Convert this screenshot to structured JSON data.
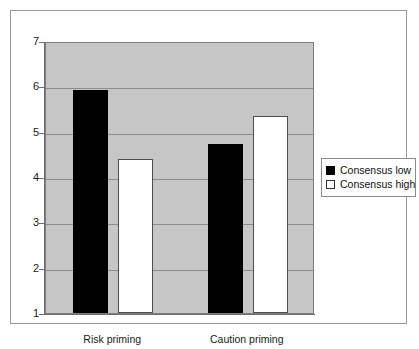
{
  "chart_data": {
    "type": "bar",
    "title": "",
    "subtitle": "",
    "xlabel": "",
    "ylabel": "",
    "categories": [
      "Risk priming",
      "Caution priming"
    ],
    "series": [
      {
        "name": "Consensus low",
        "color": "#000000",
        "values": [
          5.92,
          4.73
        ]
      },
      {
        "name": "Consensus high",
        "color": "#ffffff",
        "values": [
          4.4,
          5.35
        ]
      }
    ],
    "ylim": [
      1,
      7
    ],
    "yticks": [
      1,
      2,
      3,
      4,
      5,
      6,
      7
    ],
    "ytick_labels": [
      "1",
      "2",
      "3",
      "4",
      "5",
      "6",
      "7"
    ],
    "grid": true,
    "grid_axis": "y",
    "legend_position": "right",
    "plot_background": "#c6c6c6",
    "figure_background": "#ffffff",
    "border_color": "#9a9a9a"
  },
  "legend": {
    "items": [
      {
        "label": "Consensus low",
        "swatch": "filled-black-square"
      },
      {
        "label": "Consensus high",
        "swatch": "outlined-white-square"
      }
    ]
  }
}
